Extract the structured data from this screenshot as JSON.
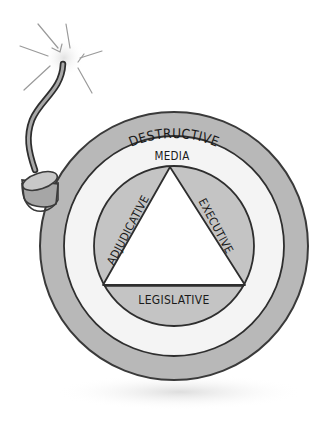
{
  "diagram": {
    "type": "bomb-concentric-rings",
    "outer_ring": {
      "label": "DESTRUCTIVE",
      "color": "#b8b8b8"
    },
    "middle_ring": {
      "label": "MEDIA",
      "color": "#f4f4f4"
    },
    "inner_segments": [
      {
        "label": "ADJUDICATIVE",
        "position": "left"
      },
      {
        "label": "EXECUTIVE",
        "position": "right"
      },
      {
        "label": "LEGISLATIVE",
        "position": "bottom"
      }
    ],
    "segment_color": "#c4c4c4",
    "center_triangle_color": "#ffffff",
    "fuse": {
      "spark": true
    }
  }
}
